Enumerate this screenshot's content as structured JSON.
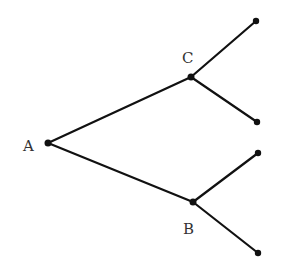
{
  "diagram": {
    "type": "tree",
    "width": 284,
    "height": 273,
    "colors": {
      "line": "#111111",
      "node": "#111111",
      "label": "#333333",
      "background": "#ffffff"
    },
    "nodes": [
      {
        "id": "A",
        "label": "A",
        "x": 48,
        "y": 143,
        "label_x": 24,
        "label_y": 151
      },
      {
        "id": "C",
        "label": "C",
        "x": 191,
        "y": 77,
        "label_x": 183,
        "label_y": 63
      },
      {
        "id": "B",
        "label": "B",
        "x": 193,
        "y": 202,
        "label_x": 184,
        "label_y": 234
      },
      {
        "id": "C1",
        "label": "",
        "x": 256,
        "y": 21
      },
      {
        "id": "C2",
        "label": "",
        "x": 257,
        "y": 122
      },
      {
        "id": "B1",
        "label": "",
        "x": 258,
        "y": 153
      },
      {
        "id": "B2",
        "label": "",
        "x": 258,
        "y": 253
      }
    ],
    "edges": [
      {
        "from": "A",
        "to": "C"
      },
      {
        "from": "A",
        "to": "B"
      },
      {
        "from": "C",
        "to": "C1"
      },
      {
        "from": "C",
        "to": "C2"
      },
      {
        "from": "B",
        "to": "B1"
      },
      {
        "from": "B",
        "to": "B2"
      }
    ]
  },
  "labels": {
    "A": "A",
    "B": "B",
    "C": "C"
  }
}
